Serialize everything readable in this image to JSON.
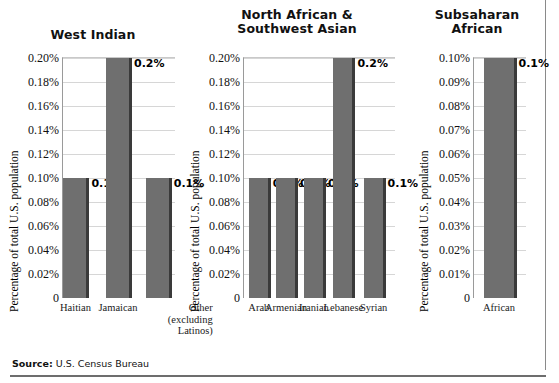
{
  "figure": {
    "source_lead": "Source:",
    "source_text": "U.S. Census Bureau",
    "ylabel": "Percentage of total U.S. population"
  },
  "chart_data": [
    {
      "type": "bar",
      "title": "West Indian",
      "categories": [
        "Haitian",
        "Jamaican",
        "Other (excluding Latinos)"
      ],
      "category_lines": [
        [
          "Haitian"
        ],
        [
          "Jamaican"
        ],
        [
          "Other",
          "(excluding",
          "Latinos)"
        ]
      ],
      "values": [
        0.1,
        0.2,
        0.1
      ],
      "data_labels": [
        "0.1%",
        "0.2%",
        "0.1%"
      ],
      "xlabel": "",
      "ylabel": "Percentage of total U.S. population",
      "ylim": [
        0,
        0.2
      ],
      "ytick_values": [
        0.2,
        0.18,
        0.16,
        0.14,
        0.12,
        0.1,
        0.08,
        0.06,
        0.04,
        0.02,
        0
      ],
      "ytick_labels": [
        "0.20%",
        "0.18%",
        "0.16%",
        "0.14%",
        "0.12%",
        "0.10%",
        "0.08%",
        "0.06%",
        "0.04%",
        "0.02%",
        "0"
      ],
      "grid": true,
      "legend": "none",
      "bar_color": "#6f6f6f"
    },
    {
      "type": "bar",
      "title": "North African & Southwest Asian",
      "title_lines": [
        "North African &",
        "Southwest Asian"
      ],
      "categories": [
        "Arab",
        "Armenian",
        "Iranian",
        "Lebanese",
        "Syrian"
      ],
      "category_lines": [
        [
          "Arab"
        ],
        [
          "Armenian"
        ],
        [
          "Iranian"
        ],
        [
          "Lebanese"
        ],
        [
          "Syrian"
        ]
      ],
      "values": [
        0.1,
        0.1,
        0.1,
        0.2,
        0.1
      ],
      "data_labels": [
        "0.1%",
        "0.1%",
        "0.1%",
        "0.2%",
        "0.1%"
      ],
      "xlabel": "",
      "ylabel": "Percentage of total U.S. population",
      "ylim": [
        0,
        0.2
      ],
      "ytick_values": [
        0.2,
        0.18,
        0.16,
        0.14,
        0.12,
        0.1,
        0.08,
        0.06,
        0.04,
        0.02,
        0
      ],
      "ytick_labels": [
        "0.20%",
        "0.18%",
        "0.16%",
        "0.14%",
        "0.12%",
        "0.10%",
        "0.08%",
        "0.06%",
        "0.04%",
        "0.02%",
        "0"
      ],
      "grid": true,
      "legend": "none",
      "bar_color": "#6f6f6f"
    },
    {
      "type": "bar",
      "title": "Subsaharan African",
      "title_lines": [
        "Subsaharan",
        "African"
      ],
      "categories": [
        "African"
      ],
      "category_lines": [
        [
          "African"
        ]
      ],
      "values": [
        0.1
      ],
      "data_labels": [
        "0.1%"
      ],
      "xlabel": "",
      "ylabel": "Percentage of total U.S. population",
      "ylim": [
        0,
        0.1
      ],
      "ytick_values": [
        0.1,
        0.09,
        0.08,
        0.07,
        0.06,
        0.05,
        0.04,
        0.03,
        0.02,
        0.01,
        0
      ],
      "ytick_labels": [
        "0.10%",
        "0.09%",
        "0.08%",
        "0.07%",
        "0.06%",
        "0.05%",
        "0.04%",
        "0.03%",
        "0.02%",
        "0.01%",
        "0"
      ],
      "grid": true,
      "legend": "none",
      "bar_color": "#6f6f6f"
    }
  ]
}
